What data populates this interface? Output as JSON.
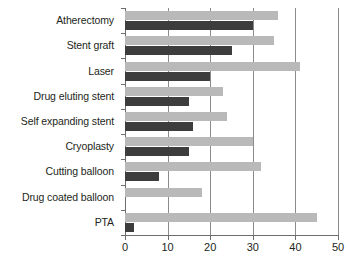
{
  "chart_data": {
    "type": "bar",
    "orientation": "horizontal",
    "title": "",
    "subtitle": "",
    "xlabel": "",
    "ylabel": "",
    "xlim": [
      0,
      50
    ],
    "xticks": [
      0,
      10,
      20,
      30,
      40,
      50
    ],
    "xtick_labels": [
      "0",
      "10",
      "20",
      "30",
      "40",
      "50"
    ],
    "grid": "vertical",
    "legend": "none",
    "categories": [
      "Atherectomy",
      "Stent graft",
      "Laser",
      "Drug eluting stent",
      "Self expanding stent",
      "Cryoplasty",
      "Cutting balloon",
      "Drug coated balloon",
      "PTA"
    ],
    "series": [
      {
        "name": "light-gray-series",
        "color": "#b9b9b9",
        "values": [
          36,
          35,
          41,
          23,
          24,
          30,
          32,
          18,
          45
        ]
      },
      {
        "name": "dark-gray-series",
        "color": "#3d3d3d",
        "values": [
          30,
          25,
          20,
          15,
          16,
          15,
          8,
          0,
          2
        ]
      }
    ],
    "colors": {
      "light_bar": "#b9b9b9",
      "dark_bar": "#3d3d3d",
      "gridline": "#8b8b8b",
      "axis": "#6e6e6e",
      "text": "#231f20",
      "background": "#ffffff"
    }
  }
}
